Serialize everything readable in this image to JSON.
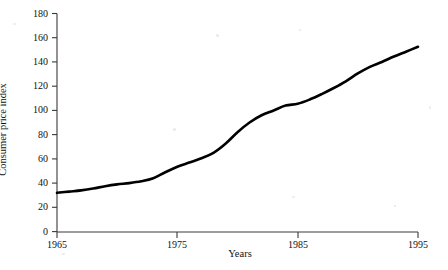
{
  "chart_data": {
    "type": "line",
    "title": "",
    "xlabel": "Years",
    "ylabel": "Consumer price index",
    "xlim": [
      1965,
      1995
    ],
    "ylim": [
      0,
      180
    ],
    "xticks": [
      1965,
      1975,
      1985,
      1995
    ],
    "yticks": [
      0,
      20,
      40,
      60,
      80,
      100,
      120,
      140,
      160,
      180
    ],
    "grid": false,
    "legend": null,
    "line_color": "#000000",
    "line_width": 2.6,
    "series": [
      {
        "name": "Consumer price index",
        "x": [
          1965,
          1966,
          1967,
          1968,
          1969,
          1970,
          1971,
          1972,
          1973,
          1974,
          1975,
          1976,
          1977,
          1978,
          1979,
          1980,
          1981,
          1982,
          1983,
          1984,
          1985,
          1986,
          1987,
          1988,
          1989,
          1990,
          1991,
          1992,
          1993,
          1994,
          1995
        ],
        "values": [
          32,
          33,
          34,
          35.5,
          37.5,
          39,
          40,
          41.5,
          44,
          49,
          53.5,
          57,
          60.5,
          65,
          72.5,
          82,
          90,
          96,
          100,
          104,
          105.5,
          109,
          113.5,
          118.5,
          124,
          130.5,
          136,
          140,
          144.5,
          148.5,
          152.5
        ]
      }
    ]
  },
  "axis": {
    "y_tick_labels": [
      "180",
      "160",
      "140",
      "120",
      "100",
      "80",
      "60",
      "40",
      "20",
      "0"
    ],
    "x_tick_labels": [
      "1965",
      "1975",
      "1985",
      "1995"
    ],
    "x_title": "Years",
    "y_title": "Consumer price index"
  },
  "style": {
    "axis_color": "#3a3a3a",
    "text_color": "#111111",
    "background": "#ffffff"
  }
}
